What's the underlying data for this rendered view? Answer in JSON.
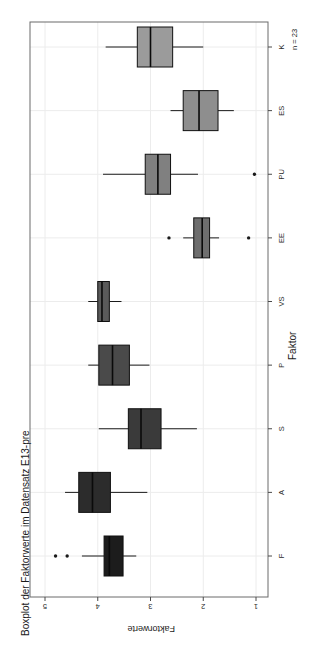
{
  "chart_data": {
    "type": "box",
    "title": "Boxplot der Faktorwerte im Datensatz E13-pre",
    "xlabel": "Faktor",
    "ylabel": "Faktorwerte",
    "annotation": "n = 23",
    "orientation": "horizontal-rotated-90",
    "value_axis": {
      "label": "Faktorwerte",
      "ticks": [
        "5",
        "4",
        "3",
        "2",
        "1"
      ],
      "tick_values": [
        5,
        4,
        3,
        2,
        1
      ],
      "range": [
        5.25,
        0.88
      ],
      "direction": "descending-left-to-right"
    },
    "category_axis": {
      "label": "Faktor",
      "categories": [
        "K",
        "ES",
        "PU",
        "EE",
        "VS",
        "P",
        "S",
        "A",
        "F"
      ]
    },
    "grid": true,
    "legend": null,
    "boxes": [
      {
        "category": "K",
        "fill": "#9b9b9b",
        "min": 3.85,
        "q1": 3.25,
        "median": 3.0,
        "q3": 2.58,
        "max": 2.0,
        "outliers": []
      },
      {
        "category": "ES",
        "fill": "#8e8e8e",
        "min": 2.62,
        "q1": 2.38,
        "median": 2.08,
        "q3": 1.72,
        "max": 1.42,
        "outliers": []
      },
      {
        "category": "PU",
        "fill": "#808080",
        "min": 3.9,
        "q1": 3.1,
        "median": 2.86,
        "q3": 2.62,
        "max": 2.1,
        "outliers": [
          1.03
        ]
      },
      {
        "category": "EE",
        "fill": "#6e6e6e",
        "min": 2.38,
        "q1": 2.18,
        "median": 2.02,
        "q3": 1.88,
        "max": 1.7,
        "outliers": [
          2.65,
          1.14
        ]
      },
      {
        "category": "VS",
        "fill": "#5a5a5a",
        "min": 4.18,
        "q1": 4.0,
        "median": 3.92,
        "q3": 3.78,
        "max": 3.55,
        "outliers": []
      },
      {
        "category": "P",
        "fill": "#4a4a4a",
        "min": 4.18,
        "q1": 3.98,
        "median": 3.72,
        "q3": 3.4,
        "max": 3.02,
        "outliers": []
      },
      {
        "category": "S",
        "fill": "#3a3a3a",
        "min": 3.98,
        "q1": 3.42,
        "median": 3.18,
        "q3": 2.8,
        "max": 2.12,
        "outliers": []
      },
      {
        "category": "A",
        "fill": "#2c2c2c",
        "min": 4.62,
        "q1": 4.36,
        "median": 4.1,
        "q3": 3.76,
        "max": 3.06,
        "outliers": []
      },
      {
        "category": "F",
        "fill": "#1c1c1c",
        "min": 4.3,
        "q1": 3.88,
        "median": 3.78,
        "q3": 3.52,
        "max": 3.27,
        "outliers": [
          4.8,
          4.58
        ]
      }
    ]
  }
}
